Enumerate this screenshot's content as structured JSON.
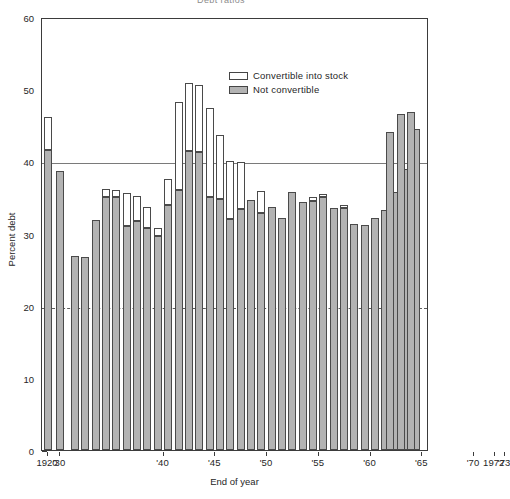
{
  "title": "Debt ratios",
  "axes": {
    "y_label": "Percent debt",
    "x_label": "End of year",
    "y_ticks": [
      0,
      10,
      20,
      30,
      40,
      50,
      60
    ],
    "y_min": 0,
    "y_max": 60,
    "x_tick_labels": [
      "1920",
      "'30",
      "'40",
      "'45",
      "'50",
      "'55",
      "'60",
      "'65",
      "'70",
      "1972",
      "'73"
    ],
    "x_tick_years": [
      1920,
      1930,
      1940,
      1945,
      1950,
      1955,
      1960,
      1965,
      1970,
      1972,
      1973
    ],
    "gridlines": [
      {
        "value": 40,
        "style": "solid"
      },
      {
        "value": 20,
        "style": "dashed"
      }
    ]
  },
  "legend": {
    "position": "top-right-inside",
    "items": [
      {
        "label": "Convertible into stock",
        "color": "#ffffff",
        "swatch": "white"
      },
      {
        "label": "Not convertible",
        "color": "#b3b3b3",
        "swatch": "gray"
      }
    ]
  },
  "colors": {
    "not_convertible": "#b3b3b3",
    "convertible": "#ffffff",
    "outline": "#4a4a4a",
    "frame": "#3b3b3b",
    "gridline": "#7a7a7a"
  },
  "chart_data": {
    "type": "bar",
    "title": "Debt ratios",
    "xlabel": "End of year",
    "ylabel": "Percent debt",
    "ylim": [
      0,
      60
    ],
    "grid": true,
    "stacked": true,
    "legend_position": "upper right",
    "categories": [
      "1920",
      "1930",
      "1931",
      "1932",
      "1933",
      "1934",
      "1935",
      "1936",
      "1937",
      "1938",
      "1939",
      "1940",
      "1941",
      "1942",
      "1943",
      "1944",
      "1945",
      "1946",
      "1947",
      "1948",
      "1949",
      "1950",
      "1951",
      "1952",
      "1953",
      "1954",
      "1955",
      "1956",
      "1957",
      "1958",
      "1959",
      "1960",
      "1961",
      "1962",
      "1963",
      "1964",
      "1965",
      "1966",
      "1967",
      "1968",
      "1969",
      "1970",
      "1971",
      "1972",
      "1973"
    ],
    "series": [
      {
        "name": "Not convertible",
        "values": [
          41.6,
          38.7,
          26.9,
          26.7,
          31.9,
          35.0,
          31.0,
          31.7,
          30.7,
          33.0,
          32.8,
          29.7,
          33.9,
          36.1,
          41.4,
          41.3,
          35.1,
          34.8,
          40.1,
          39.9,
          34.7,
          32.9,
          33.7,
          32.2,
          35.8,
          34.4,
          34.5,
          35.0,
          33.6,
          33.6,
          31.3,
          31.2,
          32.2,
          33.2,
          35.8,
          38.9,
          44.5,
          44.0,
          46.5,
          46.9,
          33.5,
          33.5,
          33.5,
          33.5,
          33.5
        ]
      },
      {
        "name": "Convertible into stock",
        "values": [
          4.5,
          0.0,
          0.0,
          0.0,
          0.0,
          1.2,
          1.0,
          4.5,
          3.5,
          3.0,
          1.1,
          7.5,
          14.1,
          14.2,
          9.3,
          9.4,
          8.2,
          5.1,
          0.0,
          0.0,
          0.0,
          0.0,
          0.0,
          0.0,
          0.0,
          0.6,
          0.8,
          0.0,
          0.0,
          0.5,
          0.0,
          0.0,
          0.0,
          0.0,
          0.0,
          0.0,
          0.0,
          0.0,
          0.0,
          0.0,
          0.0,
          0.0,
          0.0,
          0.0,
          0.0
        ]
      }
    ],
    "bars": [
      {
        "year": "1920",
        "gray": 41.6,
        "white_top": 46.2
      },
      {
        "year": "1930",
        "gray": 38.7,
        "white_top": 38.7
      },
      {
        "year": "1937",
        "gray": 26.9,
        "white_top": 26.9
      },
      {
        "year": "1938",
        "gray": 26.7,
        "white_top": 26.7
      },
      {
        "year": "1939",
        "gray": 31.9,
        "white_top": 31.9
      },
      {
        "year": "1940",
        "gray": 35.0,
        "white_top": 36.2
      },
      {
        "year": "1941",
        "gray": 35.0,
        "white_top": 36.0
      },
      {
        "year": "1942",
        "gray": 31.0,
        "white_top": 35.5
      },
      {
        "year": "1943",
        "gray": 31.7,
        "white_top": 35.2
      },
      {
        "year": "1944",
        "gray": 30.7,
        "white_top": 33.7
      },
      {
        "year": "1945",
        "gray": 29.7,
        "white_top": 30.8
      },
      {
        "year": "1946",
        "gray": 33.9,
        "white_top": 37.5
      },
      {
        "year": "1947",
        "gray": 36.1,
        "white_top": 48.2
      },
      {
        "year": "1948",
        "gray": 41.4,
        "white_top": 50.9
      },
      {
        "year": "1949",
        "gray": 41.3,
        "white_top": 50.6
      },
      {
        "year": "1950",
        "gray": 35.1,
        "white_top": 47.4
      },
      {
        "year": "1951",
        "gray": 34.8,
        "white_top": 43.6
      },
      {
        "year": "1952",
        "gray": 32.0,
        "white_top": 40.1
      },
      {
        "year": "1953",
        "gray": 33.4,
        "white_top": 39.9
      },
      {
        "year": "1954",
        "gray": 34.7,
        "white_top": 34.7
      },
      {
        "year": "1955",
        "gray": 32.9,
        "white_top": 35.9
      },
      {
        "year": "1956",
        "gray": 33.7,
        "white_top": 33.7
      },
      {
        "year": "1957",
        "gray": 32.2,
        "white_top": 32.2
      },
      {
        "year": "1958",
        "gray": 35.8,
        "white_top": 35.8
      },
      {
        "year": "1959",
        "gray": 34.4,
        "white_top": 34.4
      },
      {
        "year": "1960",
        "gray": 34.5,
        "white_top": 35.0
      },
      {
        "year": "1961",
        "gray": 35.0,
        "white_top": 35.5
      },
      {
        "year": "1962",
        "gray": 33.6,
        "white_top": 33.6
      },
      {
        "year": "1963",
        "gray": 33.6,
        "white_top": 34.0
      },
      {
        "year": "1964",
        "gray": 31.3,
        "white_top": 31.3
      },
      {
        "year": "1965",
        "gray": 31.2,
        "white_top": 31.2
      },
      {
        "year": "1966",
        "gray": 32.2,
        "white_top": 32.2
      },
      {
        "year": "1967",
        "gray": 33.2,
        "white_top": 33.2
      },
      {
        "year": "1968",
        "gray": 35.8,
        "white_top": 35.8
      },
      {
        "year": "1969",
        "gray": 38.9,
        "white_top": 38.9
      },
      {
        "year": "1970",
        "gray": 44.5,
        "white_top": 44.5
      },
      {
        "year": "1971",
        "gray": 44.0,
        "white_top": 44.0
      },
      {
        "year": "1972",
        "gray": 46.5,
        "white_top": 46.5
      },
      {
        "year": "1973",
        "gray": 46.9,
        "white_top": 46.9
      }
    ]
  },
  "bar_layout": [
    {
      "year": "1920",
      "x": 2,
      "w": 8,
      "gray": 41.6,
      "top": 46.2
    },
    {
      "year": "1930",
      "x": 14,
      "w": 8,
      "gray": 38.7,
      "top": 38.7
    },
    {
      "year": "1936",
      "x": 29,
      "w": 8,
      "gray": 26.9,
      "top": 26.9
    },
    {
      "year": "1937",
      "x": 39,
      "w": 8,
      "gray": 26.7,
      "top": 26.7
    },
    {
      "year": "1938",
      "x": 50,
      "w": 8,
      "gray": 31.9,
      "top": 31.9
    },
    {
      "year": "1939",
      "x": 60,
      "w": 8,
      "gray": 35.0,
      "top": 36.2
    },
    {
      "year": "1940",
      "x": 70,
      "w": 8,
      "gray": 35.0,
      "top": 36.0
    },
    {
      "year": "1941",
      "x": 81,
      "w": 8,
      "gray": 31.0,
      "top": 35.6
    },
    {
      "year": "1942",
      "x": 91,
      "w": 8,
      "gray": 31.7,
      "top": 35.2
    },
    {
      "year": "1943",
      "x": 101,
      "w": 8,
      "gray": 30.7,
      "top": 33.7
    },
    {
      "year": "1944",
      "x": 112,
      "w": 8,
      "gray": 29.7,
      "top": 30.8
    },
    {
      "year": "1945",
      "x": 122,
      "w": 8,
      "gray": 33.9,
      "top": 37.5
    },
    {
      "year": "1946",
      "x": 133,
      "w": 8,
      "gray": 36.1,
      "top": 48.2
    },
    {
      "year": "1947",
      "x": 143,
      "w": 8,
      "gray": 41.4,
      "top": 50.9
    },
    {
      "year": "1948",
      "x": 153,
      "w": 8,
      "gray": 41.3,
      "top": 50.6
    },
    {
      "year": "1949",
      "x": 164,
      "w": 8,
      "gray": 35.1,
      "top": 47.4
    },
    {
      "year": "1950",
      "x": 174,
      "w": 8,
      "gray": 34.8,
      "top": 43.6
    },
    {
      "year": "1951",
      "x": 184,
      "w": 8,
      "gray": 32.0,
      "top": 40.1
    },
    {
      "year": "1952",
      "x": 195,
      "w": 8,
      "gray": 33.4,
      "top": 39.9
    },
    {
      "year": "1953",
      "x": 205,
      "w": 8,
      "gray": 34.7,
      "top": 34.7
    },
    {
      "year": "1954",
      "x": 215,
      "w": 8,
      "gray": 32.9,
      "top": 35.9
    },
    {
      "year": "1955",
      "x": 226,
      "w": 8,
      "gray": 33.7,
      "top": 33.7
    },
    {
      "year": "1956",
      "x": 236,
      "w": 8,
      "gray": 32.2,
      "top": 32.2
    },
    {
      "year": "1957",
      "x": 246,
      "w": 8,
      "gray": 35.8,
      "top": 35.8
    },
    {
      "year": "1958",
      "x": 257,
      "w": 8,
      "gray": 34.4,
      "top": 34.4
    },
    {
      "year": "1959",
      "x": 267,
      "w": 8,
      "gray": 34.5,
      "top": 35.0
    },
    {
      "year": "1960",
      "x": 277,
      "w": 8,
      "gray": 35.0,
      "top": 35.5
    },
    {
      "year": "1961",
      "x": 288,
      "w": 8,
      "gray": 33.6,
      "top": 33.6
    },
    {
      "year": "1962",
      "x": 298,
      "w": 8,
      "gray": 33.6,
      "top": 34.0
    },
    {
      "year": "1963",
      "x": 308,
      "w": 8,
      "gray": 31.3,
      "top": 31.3
    },
    {
      "year": "1964",
      "x": 319,
      "w": 8,
      "gray": 31.2,
      "top": 31.2
    },
    {
      "year": "1965",
      "x": 329,
      "w": 8,
      "gray": 32.2,
      "top": 32.2
    },
    {
      "year": "1966",
      "x": 339,
      "w": 8,
      "gray": 33.2,
      "top": 33.2
    },
    {
      "year": "1967",
      "x": 350,
      "w": 8,
      "gray": 35.8,
      "top": 35.8
    },
    {
      "year": "1968",
      "x": 360,
      "w": 8,
      "gray": 38.9,
      "top": 38.9
    },
    {
      "year": "1969",
      "x": 370,
      "w": 8,
      "gray": 44.5,
      "top": 44.5
    },
    {
      "year": "1970",
      "x": 344,
      "w": 8,
      "gray": 44.0,
      "top": 44.0
    },
    {
      "year": "1971",
      "x": 355,
      "w": 8,
      "gray": 46.5,
      "top": 46.5
    },
    {
      "year": "1972",
      "x": 365,
      "w": 8,
      "gray": 46.9,
      "top": 46.9
    }
  ]
}
